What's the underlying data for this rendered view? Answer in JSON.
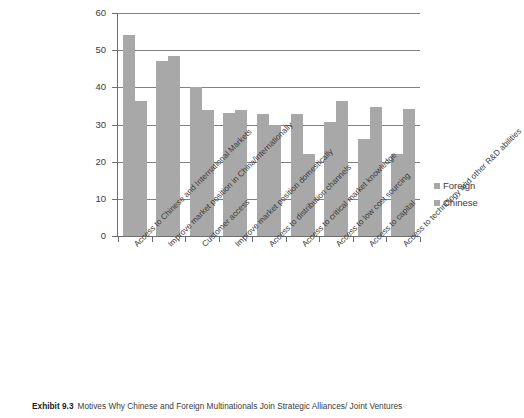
{
  "chart_data": {
    "type": "bar",
    "title": "",
    "xlabel": "",
    "ylabel": "",
    "ylim": [
      0,
      60
    ],
    "yticks": [
      0,
      10,
      20,
      30,
      40,
      50,
      60
    ],
    "grid": true,
    "legend_position": "right",
    "categories": [
      "Access to Chinese and International Markets",
      "Improve market position in China/internationally",
      "Customer access",
      "Improve market position domestically",
      "Access to distribution channels",
      "Access to critical market knowledge",
      "Access to low cost sourcing",
      "Access to capital",
      "Access to technology and other R&D abilities"
    ],
    "series": [
      {
        "name": "Foreign",
        "color": "#a8a8a8",
        "values": [
          54.0,
          47.0,
          40.0,
          33.0,
          32.8,
          32.9,
          30.8,
          26.0,
          22.0
        ]
      },
      {
        "name": "Chinese",
        "color": "#a8a8a8",
        "values": [
          36.3,
          48.4,
          34.0,
          34.0,
          30.0,
          22.2,
          36.4,
          34.7,
          34.2
        ]
      }
    ]
  },
  "legend": {
    "items": [
      {
        "label": "Foreign"
      },
      {
        "label": "Chinese"
      }
    ]
  },
  "caption": {
    "exhibit": "Exhibit 9.3",
    "text": "Motives Why Chinese and Foreign Multinationals Join Strategic Alliances/ Joint Ventures"
  }
}
